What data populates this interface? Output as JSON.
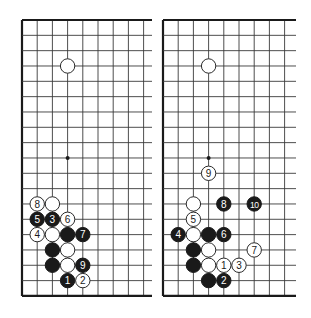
{
  "figure": {
    "grid": {
      "spacing_x": 15.2,
      "spacing_y": 15.33,
      "rows": 19,
      "stone_radius": 7.2
    },
    "boards": [
      {
        "name": "diagram-left",
        "origin": [
          22,
          20
        ],
        "cols_visible": 9,
        "right_extent": 152,
        "bottom_extent": 296,
        "edges": [
          "left",
          "top",
          "bottom"
        ],
        "hoshi": [
          [
            3,
            9
          ]
        ],
        "stones": [
          {
            "col": 3,
            "row": 3,
            "color": "white",
            "label": ""
          },
          {
            "col": 1,
            "row": 12,
            "color": "white",
            "label": "8"
          },
          {
            "col": 2,
            "row": 12,
            "color": "white",
            "label": ""
          },
          {
            "col": 1,
            "row": 13,
            "color": "black",
            "label": "5"
          },
          {
            "col": 2,
            "row": 13,
            "color": "black",
            "label": "3"
          },
          {
            "col": 3,
            "row": 13,
            "color": "white",
            "label": "6"
          },
          {
            "col": 1,
            "row": 14,
            "color": "white",
            "label": "4"
          },
          {
            "col": 2,
            "row": 14,
            "color": "white",
            "label": ""
          },
          {
            "col": 3,
            "row": 14,
            "color": "black",
            "label": ""
          },
          {
            "col": 4,
            "row": 14,
            "color": "black",
            "label": "7"
          },
          {
            "col": 2,
            "row": 15,
            "color": "black",
            "label": ""
          },
          {
            "col": 3,
            "row": 15,
            "color": "white",
            "label": ""
          },
          {
            "col": 2,
            "row": 16,
            "color": "black",
            "label": ""
          },
          {
            "col": 3,
            "row": 16,
            "color": "white",
            "label": ""
          },
          {
            "col": 4,
            "row": 16,
            "color": "black",
            "label": "9"
          },
          {
            "col": 3,
            "row": 17,
            "color": "black",
            "label": "1"
          },
          {
            "col": 4,
            "row": 17,
            "color": "white",
            "label": "2"
          }
        ]
      },
      {
        "name": "diagram-right",
        "origin": [
          163,
          20
        ],
        "cols_visible": 9,
        "right_extent": 296,
        "bottom_extent": 296,
        "edges": [
          "left",
          "top",
          "bottom"
        ],
        "hoshi": [
          [
            3,
            9
          ]
        ],
        "stones": [
          {
            "col": 3,
            "row": 3,
            "color": "white",
            "label": ""
          },
          {
            "col": 3,
            "row": 10,
            "color": "white",
            "label": "9"
          },
          {
            "col": 2,
            "row": 12,
            "color": "white",
            "label": ""
          },
          {
            "col": 4,
            "row": 12,
            "color": "black",
            "label": "8"
          },
          {
            "col": 6,
            "row": 12,
            "color": "black",
            "label": "10"
          },
          {
            "col": 2,
            "row": 13,
            "color": "white",
            "label": "5"
          },
          {
            "col": 1,
            "row": 14,
            "color": "black",
            "label": "4"
          },
          {
            "col": 2,
            "row": 14,
            "color": "white",
            "label": ""
          },
          {
            "col": 3,
            "row": 14,
            "color": "black",
            "label": ""
          },
          {
            "col": 4,
            "row": 14,
            "color": "black",
            "label": "6"
          },
          {
            "col": 2,
            "row": 15,
            "color": "black",
            "label": ""
          },
          {
            "col": 3,
            "row": 15,
            "color": "white",
            "label": ""
          },
          {
            "col": 6,
            "row": 15,
            "color": "white",
            "label": "7"
          },
          {
            "col": 2,
            "row": 16,
            "color": "black",
            "label": ""
          },
          {
            "col": 3,
            "row": 16,
            "color": "white",
            "label": ""
          },
          {
            "col": 4,
            "row": 16,
            "color": "white",
            "label": "1"
          },
          {
            "col": 5,
            "row": 16,
            "color": "white",
            "label": "3"
          },
          {
            "col": 3,
            "row": 17,
            "color": "black",
            "label": ""
          },
          {
            "col": 4,
            "row": 17,
            "color": "black",
            "label": "2"
          }
        ]
      }
    ]
  }
}
